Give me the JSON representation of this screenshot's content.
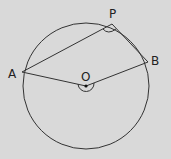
{
  "diagram": {
    "background": "#d9d9d9",
    "stroke_color": "#333333",
    "circle": {
      "center": "O",
      "cx": 86,
      "cy": 86,
      "r": 63
    },
    "points": [
      {
        "name": "A",
        "label": "A",
        "x": 22,
        "y": 72
      },
      {
        "name": "P",
        "label": "P",
        "x": 112,
        "y": 24
      },
      {
        "name": "B",
        "label": "B",
        "x": 148,
        "y": 62
      },
      {
        "name": "O",
        "label": "O",
        "x": 86,
        "y": 86
      }
    ],
    "segments": [
      "AP",
      "PB",
      "AO",
      "OB"
    ],
    "angle_marks": [
      "APB",
      "reflex AOB"
    ]
  }
}
